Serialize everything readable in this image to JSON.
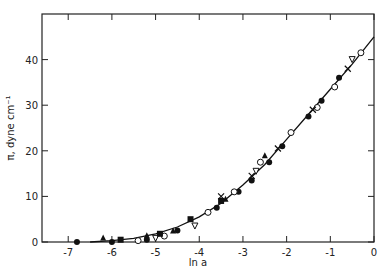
{
  "chart_data": {
    "type": "scatter",
    "title": "",
    "xlabel": "ln a",
    "ylabel": "π, dyne cm⁻¹",
    "xlim": [
      -7.6,
      0
    ],
    "ylim": [
      0,
      50
    ],
    "x_ticks": [
      "-7",
      "-6",
      "-5",
      "-4",
      "-3",
      "-2",
      "-1",
      "0"
    ],
    "y_ticks": [
      "0",
      "10",
      "20",
      "30",
      "40"
    ],
    "grid": false,
    "legend": "none",
    "fit_curve": {
      "x": [
        -6.5,
        -6.0,
        -5.5,
        -5.0,
        -4.5,
        -4.0,
        -3.5,
        -3.0,
        -2.5,
        -2.0,
        -1.5,
        -1.0,
        -0.5,
        0.0
      ],
      "y": [
        0,
        0.3,
        0.8,
        1.8,
        3.3,
        5.5,
        8.5,
        12.5,
        17.0,
        22.5,
        28.0,
        33.5,
        39.0,
        45.0
      ]
    },
    "series": [
      {
        "name": "filled-circle",
        "marker": "circle-filled",
        "x": [
          -6.8,
          -6.0,
          -5.2,
          -4.5,
          -3.6,
          -3.1,
          -2.8,
          -2.4,
          -2.1,
          -1.5,
          -1.2,
          -0.8
        ],
        "y": [
          0,
          0,
          0.5,
          2.5,
          7.5,
          11.0,
          13.5,
          17.5,
          21.0,
          27.5,
          31.0,
          36.0
        ]
      },
      {
        "name": "open-circle",
        "marker": "circle-open",
        "x": [
          -5.4,
          -4.8,
          -3.8,
          -3.2,
          -2.6,
          -1.9,
          -1.3,
          -0.9,
          -0.3
        ],
        "y": [
          0.3,
          1.3,
          6.5,
          11.0,
          17.5,
          24.0,
          29.5,
          34.0,
          41.5
        ]
      },
      {
        "name": "filled-triangle",
        "marker": "triangle-filled",
        "x": [
          -6.2,
          -5.2,
          -4.6,
          -3.4,
          -2.5
        ],
        "y": [
          1.0,
          1.5,
          2.5,
          9.5,
          19.0
        ]
      },
      {
        "name": "open-triangle-down",
        "marker": "triangle-down-open",
        "x": [
          -5.0,
          -4.1,
          -2.7,
          -0.5
        ],
        "y": [
          0.8,
          3.5,
          15.5,
          40.0
        ]
      },
      {
        "name": "filled-square",
        "marker": "square-filled",
        "x": [
          -5.8,
          -4.9,
          -4.2,
          -3.5
        ],
        "y": [
          0.5,
          1.8,
          5.0,
          9.0
        ]
      },
      {
        "name": "cross",
        "marker": "x",
        "x": [
          -3.5,
          -2.8,
          -2.2,
          -1.4,
          -0.6
        ],
        "y": [
          10.0,
          14.5,
          20.5,
          29.0,
          38.0
        ]
      }
    ]
  },
  "axes": {
    "xlabel": "ln a",
    "ylabel": "π, dyne cm⁻¹"
  }
}
